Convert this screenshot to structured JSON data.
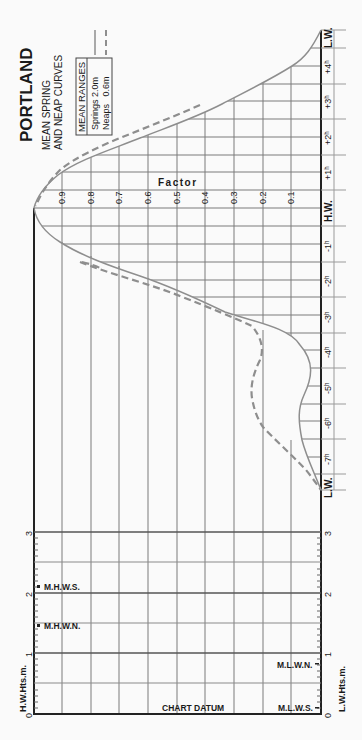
{
  "title": "PORTLAND",
  "subtitle_line1": "MEAN SPRING",
  "subtitle_line2": "AND NEAP CURVES",
  "legend": {
    "heading": "MEAN RANGES",
    "springs": "Springs 2.0m",
    "neaps": "Neaps   0.6m"
  },
  "factor_axis": {
    "label": "Factor",
    "ticks": [
      "0.9",
      "0.8",
      "0.7",
      "0.6",
      "0.5",
      "0.4",
      "0.3",
      "0.2",
      "0.1"
    ]
  },
  "time_axis": {
    "labels": [
      "L.W.",
      "+4h",
      "+3h",
      "+2h",
      "+1h",
      "H.W.",
      "-1h",
      "-2h",
      "-3h",
      "-4h",
      "-5h",
      "-6h",
      "-7h",
      "L.W."
    ],
    "display": [
      "L.W.",
      "+4ʰ",
      "+3ʰ",
      "+2ʰ",
      "+1ʰ",
      "H.W.",
      "-1ʰ",
      "-2ʰ",
      "-3ʰ",
      "-4ʰ",
      "-5ʰ",
      "-6ʰ",
      "-7ʰ",
      "L.W."
    ]
  },
  "height_panel": {
    "hw_axis_label": "H.W.Hts.m.",
    "lw_axis_label": "L.W.Hts.m.",
    "ticks": [
      "0",
      "1",
      "2",
      "3"
    ],
    "chart_datum": "CHART DATUM",
    "mhws": "M.H.W.S.",
    "mhwn": "M.H.W.N.",
    "mlwn": "M.L.W.N.",
    "mlws": "M.L.W.S.",
    "levels_m": {
      "MHWS": 2.0,
      "MHWN": 1.5,
      "MLWN": 0.9,
      "MLWS": 0.1
    }
  },
  "colors": {
    "curve": "#8e8e8e",
    "grid": "#7a7a7a",
    "axis": "#222222",
    "background": "#fafafa"
  }
}
